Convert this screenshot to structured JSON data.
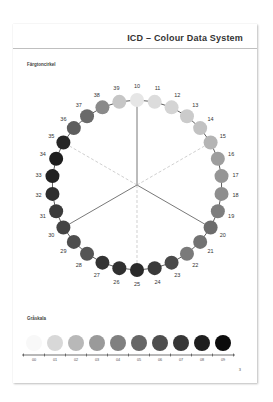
{
  "header": {
    "title": "ICD – Colour Data System"
  },
  "wheel": {
    "label": "Färgtoncirkel",
    "center": [
      124,
      161
    ],
    "radius": 85,
    "dot_radius": 7,
    "solid_spokes": [
      "10",
      "20",
      "30"
    ],
    "dashed_spokes": [
      "15",
      "25",
      "35"
    ],
    "dots": [
      {
        "n": "10",
        "color": "#e6e6e6"
      },
      {
        "n": "11",
        "color": "#dcdcdc"
      },
      {
        "n": "12",
        "color": "#d4d4d4"
      },
      {
        "n": "13",
        "color": "#cbcbcb"
      },
      {
        "n": "14",
        "color": "#c2c2c2"
      },
      {
        "n": "15",
        "color": "#b4b4b4"
      },
      {
        "n": "16",
        "color": "#9e9e9e"
      },
      {
        "n": "17",
        "color": "#959595"
      },
      {
        "n": "18",
        "color": "#8e8e8e"
      },
      {
        "n": "19",
        "color": "#7e7e7e"
      },
      {
        "n": "20",
        "color": "#6c6c6c"
      },
      {
        "n": "21",
        "color": "#727272"
      },
      {
        "n": "22",
        "color": "#7a7a7a"
      },
      {
        "n": "23",
        "color": "#4a4a4a"
      },
      {
        "n": "24",
        "color": "#3a3a3a"
      },
      {
        "n": "25",
        "color": "#2a2a2a"
      },
      {
        "n": "26",
        "color": "#303030"
      },
      {
        "n": "27",
        "color": "#333333"
      },
      {
        "n": "28",
        "color": "#555555"
      },
      {
        "n": "29",
        "color": "#4e4e4e"
      },
      {
        "n": "30",
        "color": "#444444"
      },
      {
        "n": "31",
        "color": "#3c3c3c"
      },
      {
        "n": "32",
        "color": "#2e2e2e"
      },
      {
        "n": "33",
        "color": "#222222"
      },
      {
        "n": "34",
        "color": "#1e1e1e"
      },
      {
        "n": "35",
        "color": "#262626"
      },
      {
        "n": "36",
        "color": "#5e5e5e"
      },
      {
        "n": "37",
        "color": "#6a6a6a"
      },
      {
        "n": "38",
        "color": "#8a8a8a"
      },
      {
        "n": "39",
        "color": "#c6c6c6"
      }
    ]
  },
  "grayscale": {
    "label": "Gråskala",
    "steps": [
      {
        "n": "00",
        "color": "#f8f8f8"
      },
      {
        "n": "01",
        "color": "#d8d8d8"
      },
      {
        "n": "02",
        "color": "#b8b8b8"
      },
      {
        "n": "03",
        "color": "#9a9a9a"
      },
      {
        "n": "04",
        "color": "#808080"
      },
      {
        "n": "05",
        "color": "#666666"
      },
      {
        "n": "06",
        "color": "#4e4e4e"
      },
      {
        "n": "07",
        "color": "#363636"
      },
      {
        "n": "08",
        "color": "#1e1e1e"
      },
      {
        "n": "09",
        "color": "#0c0c0c"
      }
    ]
  },
  "footer": {
    "page_number": "3"
  }
}
